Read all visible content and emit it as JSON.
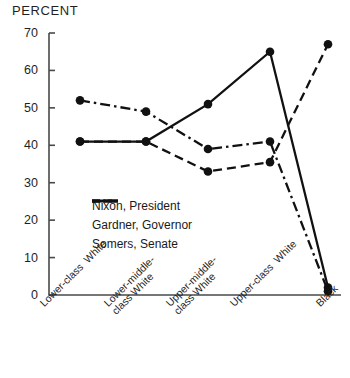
{
  "chart_data": {
    "type": "line",
    "title": "",
    "ylabel": "PERCENT",
    "xlabel": "",
    "ylim": [
      0,
      70
    ],
    "yticks": [
      0,
      10,
      20,
      30,
      40,
      50,
      60,
      70
    ],
    "ytick_labels": [
      "0",
      "10",
      "20",
      "30",
      "40",
      "50",
      "60",
      "70"
    ],
    "grid": false,
    "legend_position": "center-left-inside",
    "categories": [
      "Lower-class  White",
      "Lower-middle-\nclass White",
      "Upper-middle-\nclass White",
      "Upper-class  White",
      "Black"
    ],
    "series": [
      {
        "name": "Nixon, President",
        "style": "solid",
        "color": "#111111",
        "values": [
          41,
          41,
          51,
          65,
          2
        ]
      },
      {
        "name": "Gardner, Governor",
        "style": "dash-dot",
        "color": "#111111",
        "values": [
          52,
          49,
          39,
          41,
          1
        ]
      },
      {
        "name": "Somers, Senate",
        "style": "dashed",
        "color": "#111111",
        "values": [
          41,
          41,
          33,
          35.5,
          67
        ]
      }
    ]
  },
  "legend": {
    "items": [
      {
        "label": "Nixon, President"
      },
      {
        "label": "Gardner, Governor"
      },
      {
        "label": "Somers, Senate"
      }
    ]
  },
  "axis": {
    "y_title": "PERCENT"
  }
}
